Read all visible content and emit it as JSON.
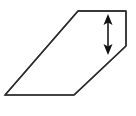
{
  "figure": {
    "title": "",
    "type": "geometry-diagram",
    "canvas": {
      "width": 136,
      "height": 116,
      "background": "#ffffff"
    },
    "shape": {
      "name": "parallelogram-with-clipped-corner",
      "description": "Slanted quadrilateral outline with a notched lower-right corner",
      "stroke_color": "#2b2b2b",
      "fill_color": "#ffffff",
      "stroke_width": 1.4,
      "vertices": [
        {
          "label": "top-left",
          "x": 78,
          "y": 11
        },
        {
          "label": "top-right",
          "x": 126,
          "y": 11
        },
        {
          "label": "right-notch",
          "x": 126,
          "y": 46
        },
        {
          "label": "bottom-right",
          "x": 74,
          "y": 95
        },
        {
          "label": "bottom-left",
          "x": 5,
          "y": 95
        }
      ],
      "edges": [
        {
          "name": "top-edge",
          "from": "top-left",
          "to": "top-right",
          "orientation": "horizontal"
        },
        {
          "name": "right-edge",
          "from": "top-right",
          "to": "right-notch",
          "orientation": "vertical"
        },
        {
          "name": "lower-right-diagonal",
          "from": "right-notch",
          "to": "bottom-right",
          "orientation": "diagonal"
        },
        {
          "name": "bottom-edge",
          "from": "bottom-right",
          "to": "bottom-left",
          "orientation": "horizontal"
        },
        {
          "name": "left-diagonal",
          "from": "bottom-left",
          "to": "top-left",
          "orientation": "diagonal"
        }
      ]
    },
    "dimension_arrow": {
      "name": "height-dimension-arrow",
      "style": "double-headed",
      "orientation": "vertical",
      "color": "#1a1a1a",
      "shaft_x": 108,
      "top_y": 14,
      "bottom_y": 55,
      "head_width": 9,
      "head_length": 11,
      "shaft_width": 1.6,
      "label": ""
    }
  }
}
